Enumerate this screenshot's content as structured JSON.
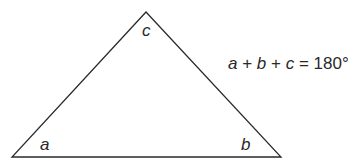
{
  "diagram": {
    "type": "triangle-angle-sum",
    "vertices": [
      {
        "id": "apex",
        "label": "c"
      },
      {
        "id": "bottom-left",
        "label": "a"
      },
      {
        "id": "bottom-right",
        "label": "b"
      }
    ],
    "formula": {
      "a": "a",
      "plus1": " + ",
      "b": "b",
      "plus2": " + ",
      "c": "c",
      "equals": " = ",
      "value": "180°"
    },
    "colors": {
      "stroke": "#2a2a2a",
      "text": "#2a2a2a",
      "background": "#ffffff"
    }
  }
}
